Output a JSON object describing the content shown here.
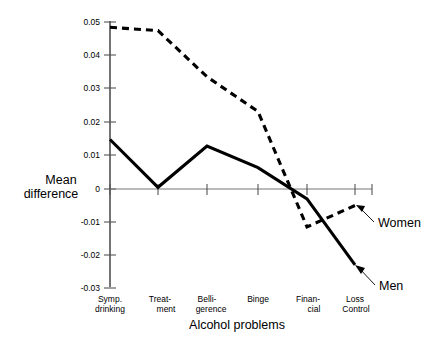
{
  "chart_data": {
    "type": "line",
    "title": "",
    "xlabel": "Alcohol problems",
    "ylabel": "Mean difference",
    "categories": [
      "Symp. drinking",
      "Treatment",
      "Belligerence",
      "Binge",
      "Financial",
      "Loss Control"
    ],
    "category_lines": [
      [
        "Symp.",
        "drinking"
      ],
      [
        "Treat-",
        "ment"
      ],
      [
        "Belli-",
        "gerence"
      ],
      [
        "Binge",
        ""
      ],
      [
        "Finan-",
        "cial"
      ],
      [
        "Loss",
        "Control"
      ]
    ],
    "ylim": [
      -0.03,
      0.05
    ],
    "yticks": [
      0.05,
      0.04,
      0.03,
      0.02,
      0.01,
      0,
      -0.01,
      -0.02,
      -0.03
    ],
    "ytick_labels": [
      "0.05",
      "0.04",
      "0.03",
      "0.02",
      "0.01",
      "0",
      "-0.01",
      "-0.02",
      "-0.03"
    ],
    "grid": false,
    "legend_position": "inline-annotation",
    "series": [
      {
        "name": "Women",
        "style": "dashed",
        "values": [
          0.049,
          0.048,
          0.034,
          0.0235,
          -0.0115,
          -0.005
        ]
      },
      {
        "name": "Men",
        "style": "solid",
        "values": [
          0.015,
          0.0005,
          0.013,
          0.0065,
          -0.003,
          -0.023
        ]
      }
    ],
    "annotations": [
      {
        "text": "Women",
        "target_series": "Women",
        "target_category": "Loss Control"
      },
      {
        "text": "Men",
        "target_series": "Men",
        "target_category": "Loss Control"
      }
    ]
  },
  "axis_titles": {
    "y_line1": "Mean",
    "y_line2": "difference",
    "x": "Alcohol problems"
  },
  "labels": {
    "women": "Women",
    "men": "Men"
  }
}
